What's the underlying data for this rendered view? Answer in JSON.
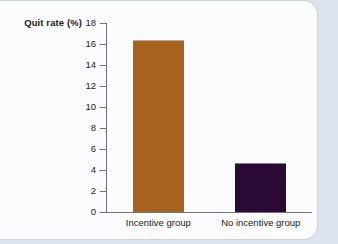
{
  "chart_data": {
    "type": "bar",
    "title": "",
    "xlabel": "",
    "ylabel": "Quit rate (%)",
    "categories": [
      "Incentive group",
      "No incentive group"
    ],
    "values": [
      16.4,
      4.7
    ],
    "ylim": [
      0,
      18
    ],
    "yticks": [
      0,
      2,
      4,
      6,
      8,
      10,
      12,
      14,
      16,
      18
    ],
    "ytick_labels": [
      "0",
      "2",
      "4",
      "6",
      "8",
      "10",
      "12",
      "14",
      "16",
      "18"
    ],
    "grid": false,
    "legend": false,
    "bar_colors": [
      "#a8631e",
      "#2a0a35"
    ]
  },
  "colors": {
    "page_background": "#dde4ee",
    "card_background": "#fbfcfe",
    "card_border": "#c8d2e0",
    "axis": "#6f7479",
    "text": "#1b1b1b"
  }
}
